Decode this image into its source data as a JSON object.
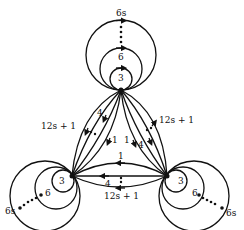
{
  "diagram": {
    "type": "multigraph-with-loops",
    "colors": {
      "stroke": "#111111",
      "background": "#ffffff"
    },
    "vertices": [
      {
        "id": "top",
        "x": 121,
        "y": 90
      },
      {
        "id": "bottom-left",
        "x": 72,
        "y": 176
      },
      {
        "id": "bottom-right",
        "x": 167,
        "y": 176
      }
    ],
    "loops": {
      "top": {
        "labels": [
          "3",
          "6",
          "6s"
        ],
        "ellipsis": "⋮"
      },
      "bottom-left": {
        "labels": [
          "3",
          "6",
          "6s"
        ],
        "ellipsis": "⋯"
      },
      "bottom-right": {
        "labels": [
          "3",
          "6",
          "6s"
        ],
        "ellipsis": "⋯"
      }
    },
    "edge_bundles": {
      "left": {
        "labels": [
          "1",
          "4",
          "12s + 1"
        ]
      },
      "right": {
        "labels": [
          "1",
          "4",
          "12s + 1"
        ]
      },
      "bottom": {
        "labels": [
          "1",
          "4",
          "12s + 1"
        ]
      }
    }
  },
  "labels": {
    "top_loop_3": "3",
    "top_loop_6": "6",
    "top_loop_6s": "6s",
    "bl_loop_3": "3",
    "bl_loop_6": "6",
    "bl_loop_6s": "6s",
    "br_loop_3": "3",
    "br_loop_6": "6",
    "br_loop_6s": "6s",
    "left_1": "1",
    "left_4": "4",
    "left_12s1": "12s + 1",
    "right_1": "1",
    "right_4": "4",
    "right_12s1": "12s + 1",
    "bottom_1": "1",
    "bottom_4": "4",
    "bottom_12s1": "12s + 1"
  }
}
